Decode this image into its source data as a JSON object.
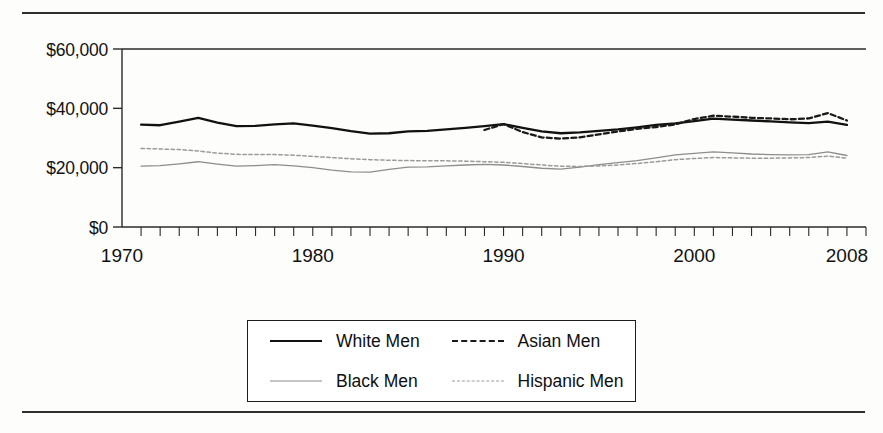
{
  "figure": {
    "has_top_rule": true,
    "has_bottom_rule": true
  },
  "axis": {
    "y_ticks": [
      "$0",
      "$20,000",
      "$40,000",
      "$60,000"
    ],
    "x_ticks": [
      "1970",
      "1980",
      "1990",
      "2000",
      "2008"
    ]
  },
  "legend": {
    "items": [
      {
        "label": "White Men",
        "style": "solid-thick",
        "color": "#111111"
      },
      {
        "label": "Asian Men",
        "style": "dash-bold",
        "color": "#1a1a1a"
      },
      {
        "label": "Black Men",
        "style": "solid-thin",
        "color": "#8d8d8d"
      },
      {
        "label": "Hispanic Men",
        "style": "dot-fine",
        "color": "#9b9b9b"
      }
    ]
  },
  "chart_data": {
    "type": "line",
    "title": "",
    "xlabel": "",
    "ylabel": "",
    "xlim": [
      1970,
      2009
    ],
    "ylim": [
      0,
      60000
    ],
    "y_tick_values": [
      0,
      20000,
      40000,
      60000
    ],
    "x_tick_values": [
      1970,
      1980,
      1990,
      2000,
      2008
    ],
    "x_minor_tick_interval": 1,
    "grid": false,
    "legend_position": "bottom-center",
    "y_axis_label_format": "$#,###",
    "x": [
      1971,
      1972,
      1973,
      1974,
      1975,
      1976,
      1977,
      1978,
      1979,
      1980,
      1981,
      1982,
      1983,
      1984,
      1985,
      1986,
      1987,
      1988,
      1989,
      1990,
      1991,
      1992,
      1993,
      1994,
      1995,
      1996,
      1997,
      1998,
      1999,
      2000,
      2001,
      2002,
      2003,
      2004,
      2005,
      2006,
      2007,
      2008
    ],
    "series": [
      {
        "name": "White Men",
        "style": "solid-thick",
        "color": "#111111",
        "values": [
          34500,
          34300,
          35500,
          36800,
          35200,
          34000,
          34100,
          34600,
          34900,
          34200,
          33300,
          32300,
          31500,
          31600,
          32200,
          32400,
          32900,
          33400,
          34000,
          34700,
          33400,
          32200,
          31600,
          31900,
          32400,
          32900,
          33600,
          34400,
          34900,
          35700,
          36500,
          36200,
          35900,
          35600,
          35300,
          35000,
          35500,
          34400
        ]
      },
      {
        "name": "Black Men",
        "style": "solid-thin",
        "color": "#8d8d8d",
        "values": [
          20500,
          20700,
          21300,
          22000,
          21200,
          20500,
          20700,
          21000,
          20600,
          20000,
          19200,
          18600,
          18500,
          19400,
          20200,
          20300,
          20600,
          20900,
          21100,
          20900,
          20400,
          19800,
          19500,
          20200,
          21000,
          21700,
          22400,
          23300,
          24300,
          24800,
          25300,
          25000,
          24600,
          24400,
          24300,
          24400,
          25300,
          24100
        ]
      },
      {
        "name": "Asian Men",
        "style": "dash-bold",
        "color": "#1a1a1a",
        "values": [
          null,
          null,
          null,
          null,
          null,
          null,
          null,
          null,
          null,
          null,
          null,
          null,
          null,
          null,
          null,
          null,
          null,
          null,
          32700,
          34700,
          32000,
          30200,
          29800,
          30200,
          31200,
          32200,
          33100,
          33700,
          34600,
          36400,
          37500,
          37200,
          36800,
          36600,
          36300,
          36600,
          38400,
          35900
        ]
      },
      {
        "name": "Hispanic Men",
        "style": "dot-fine",
        "color": "#9b9b9b",
        "values": [
          26500,
          26300,
          26100,
          25600,
          24900,
          24500,
          24400,
          24400,
          24200,
          23800,
          23400,
          23000,
          22700,
          22500,
          22400,
          22300,
          22300,
          22200,
          22000,
          21800,
          21400,
          20900,
          20500,
          20400,
          20600,
          20900,
          21400,
          22000,
          22700,
          23100,
          23400,
          23300,
          23200,
          23200,
          23300,
          23400,
          23900,
          23200
        ]
      }
    ]
  }
}
